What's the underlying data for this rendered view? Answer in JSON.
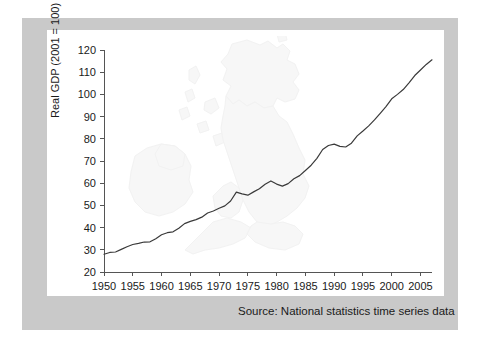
{
  "figure": {
    "source_note": "Source: National statistics time series data",
    "frame_color": "#c9c9c9",
    "panel_color": "#ffffff",
    "line_color": "#3a3a3a",
    "watermark": "british-isles-map"
  },
  "chart_data": {
    "type": "line",
    "title": "",
    "subtitle": "",
    "xlabel": "",
    "ylabel": "Real GDP (2001 = 100)",
    "xlim": [
      1950,
      2007
    ],
    "ylim": [
      20,
      120
    ],
    "grid": false,
    "legend": null,
    "xticks": [
      1950,
      1955,
      1960,
      1965,
      1970,
      1975,
      1980,
      1985,
      1990,
      1995,
      2000,
      2005
    ],
    "yticks": [
      20,
      30,
      40,
      50,
      60,
      70,
      80,
      90,
      100,
      110,
      120
    ],
    "series": [
      {
        "name": "Real GDP (2001 = 100)",
        "x": [
          1950,
          1951,
          1952,
          1953,
          1954,
          1955,
          1956,
          1957,
          1958,
          1959,
          1960,
          1961,
          1962,
          1963,
          1964,
          1965,
          1966,
          1967,
          1968,
          1969,
          1970,
          1971,
          1972,
          1973,
          1974,
          1975,
          1976,
          1977,
          1978,
          1979,
          1980,
          1981,
          1982,
          1983,
          1984,
          1985,
          1986,
          1987,
          1988,
          1989,
          1990,
          1991,
          1992,
          1993,
          1994,
          1995,
          1996,
          1997,
          1998,
          1999,
          2000,
          2001,
          2002,
          2003,
          2004,
          2005,
          2006,
          2007
        ],
        "values": [
          28.0,
          28.8,
          29.0,
          30.2,
          31.4,
          32.4,
          32.9,
          33.5,
          33.6,
          35.0,
          36.8,
          37.7,
          38.1,
          39.7,
          41.8,
          42.8,
          43.6,
          44.7,
          46.6,
          47.5,
          48.7,
          49.8,
          52.0,
          56.0,
          55.2,
          54.6,
          56.1,
          57.5,
          59.5,
          61.0,
          59.6,
          58.7,
          59.8,
          62.0,
          63.4,
          65.7,
          68.1,
          71.2,
          75.2,
          77.0,
          77.6,
          76.6,
          76.3,
          78.0,
          81.3,
          83.5,
          85.8,
          88.5,
          91.5,
          94.5,
          98.0,
          100.0,
          102.2,
          105.2,
          108.5,
          111.0,
          113.5,
          115.6
        ]
      }
    ]
  },
  "axis": {
    "y_title": "Real GDP (2001 = 100)"
  }
}
